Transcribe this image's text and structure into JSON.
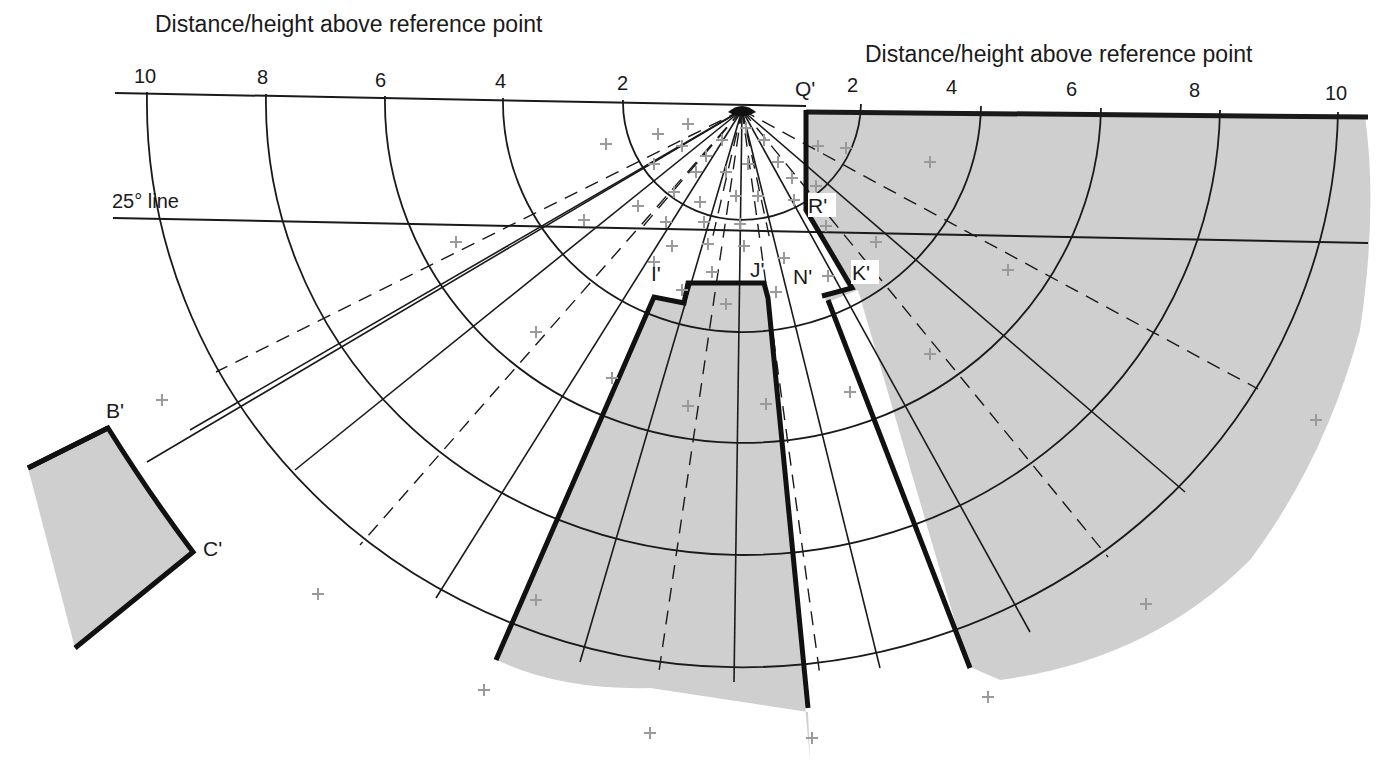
{
  "title_left": "Distance/height above reference point",
  "title_right": "Distance/height above reference point",
  "ticks_left": [
    "10",
    "8",
    "6",
    "4",
    "2"
  ],
  "ticks_right": [
    "2",
    "4",
    "6",
    "8",
    "10"
  ],
  "line_label": "25° line",
  "points": {
    "Q": "Q'",
    "R": "R'",
    "I": "I'",
    "J": "J'",
    "N": "N'",
    "K": "K'",
    "B": "B'",
    "C": "C'"
  },
  "colors": {
    "shade": "#cfcfcf",
    "line": "#1a1a1a",
    "cross": "#9a9a9a",
    "background": "#ffffff"
  },
  "grid": {
    "rings": [
      2,
      4,
      6,
      8,
      10
    ],
    "center_px": [
      742,
      110
    ],
    "unit_px": 59.5
  }
}
